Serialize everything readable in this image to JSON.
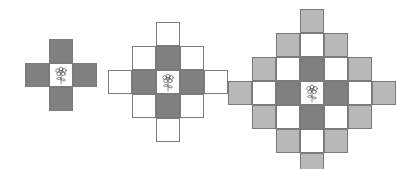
{
  "figure_set": {
    "background_color": "#ffffff",
    "palette": {
      "dark_gray": "#808080",
      "light_gray": "#b8b8b8",
      "white": "#ffffff",
      "outline": "#7b7b7b"
    },
    "center_motif": "flower-icon",
    "figures": [
      {
        "name": "figure-1-plus",
        "label": "",
        "origin": [
          25,
          39
        ],
        "cell": 24,
        "grid": 3,
        "cells": [
          {
            "col": 1,
            "row": 0,
            "fill": "dark"
          },
          {
            "col": 0,
            "row": 1,
            "fill": "dark"
          },
          {
            "col": 1,
            "row": 1,
            "fill": "white",
            "center": true
          },
          {
            "col": 2,
            "row": 1,
            "fill": "dark"
          },
          {
            "col": 1,
            "row": 2,
            "fill": "dark"
          }
        ]
      },
      {
        "name": "figure-2-diamond-5",
        "label": "",
        "origin": [
          108,
          22
        ],
        "cell": 24,
        "grid": 5,
        "cells": [
          {
            "col": 2,
            "row": 0,
            "fill": "white"
          },
          {
            "col": 1,
            "row": 1,
            "fill": "white"
          },
          {
            "col": 2,
            "row": 1,
            "fill": "dark"
          },
          {
            "col": 3,
            "row": 1,
            "fill": "white"
          },
          {
            "col": 0,
            "row": 2,
            "fill": "white"
          },
          {
            "col": 1,
            "row": 2,
            "fill": "dark"
          },
          {
            "col": 2,
            "row": 2,
            "fill": "white",
            "center": true
          },
          {
            "col": 3,
            "row": 2,
            "fill": "dark"
          },
          {
            "col": 4,
            "row": 2,
            "fill": "white"
          },
          {
            "col": 1,
            "row": 3,
            "fill": "white"
          },
          {
            "col": 2,
            "row": 3,
            "fill": "dark"
          },
          {
            "col": 3,
            "row": 3,
            "fill": "white"
          },
          {
            "col": 2,
            "row": 4,
            "fill": "white"
          }
        ]
      },
      {
        "name": "figure-3-diamond-7",
        "label": "",
        "origin": [
          228,
          9
        ],
        "cell": 24,
        "grid": 7,
        "cells": [
          {
            "col": 3,
            "row": 0,
            "fill": "light"
          },
          {
            "col": 2,
            "row": 1,
            "fill": "light"
          },
          {
            "col": 3,
            "row": 1,
            "fill": "white"
          },
          {
            "col": 4,
            "row": 1,
            "fill": "light"
          },
          {
            "col": 1,
            "row": 2,
            "fill": "light"
          },
          {
            "col": 2,
            "row": 2,
            "fill": "white"
          },
          {
            "col": 3,
            "row": 2,
            "fill": "dark"
          },
          {
            "col": 4,
            "row": 2,
            "fill": "white"
          },
          {
            "col": 5,
            "row": 2,
            "fill": "light"
          },
          {
            "col": 0,
            "row": 3,
            "fill": "light"
          },
          {
            "col": 1,
            "row": 3,
            "fill": "white"
          },
          {
            "col": 2,
            "row": 3,
            "fill": "dark"
          },
          {
            "col": 3,
            "row": 3,
            "fill": "white",
            "center": true
          },
          {
            "col": 4,
            "row": 3,
            "fill": "dark"
          },
          {
            "col": 5,
            "row": 3,
            "fill": "white"
          },
          {
            "col": 6,
            "row": 3,
            "fill": "light"
          },
          {
            "col": 1,
            "row": 4,
            "fill": "light"
          },
          {
            "col": 2,
            "row": 4,
            "fill": "white"
          },
          {
            "col": 3,
            "row": 4,
            "fill": "dark"
          },
          {
            "col": 4,
            "row": 4,
            "fill": "white"
          },
          {
            "col": 5,
            "row": 4,
            "fill": "light"
          },
          {
            "col": 2,
            "row": 5,
            "fill": "light"
          },
          {
            "col": 3,
            "row": 5,
            "fill": "white"
          },
          {
            "col": 4,
            "row": 5,
            "fill": "light"
          },
          {
            "col": 3,
            "row": 6,
            "fill": "light"
          }
        ]
      }
    ]
  }
}
